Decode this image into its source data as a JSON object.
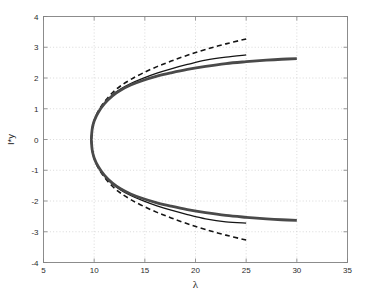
{
  "chart_data": {
    "type": "line",
    "title": "",
    "xlabel": "λ",
    "ylabel": "I*y",
    "xlim": [
      5,
      35
    ],
    "ylim": [
      -4,
      4
    ],
    "xticks": [
      5,
      10,
      15,
      20,
      25,
      30,
      35
    ],
    "yticks": [
      -4,
      -3,
      -2,
      -1,
      0,
      1,
      2,
      3,
      4
    ],
    "xtick_labels": [
      "5",
      "10",
      "15",
      "20",
      "25",
      "30",
      "35"
    ],
    "ytick_labels": [
      "-4",
      "-3",
      "-2",
      "-1",
      "0",
      "1",
      "2",
      "3",
      "4"
    ],
    "grid": true,
    "grid_style": "dotted",
    "grid_color": "#c8c8c8",
    "background_color": "#ffffff",
    "axes_color": "#808080",
    "legend": null,
    "legend_position": "none",
    "vertex_lambda": 9.7,
    "series": [
      {
        "name": "dashed-upper",
        "style": "dashed",
        "color": "#151515",
        "width": 1.6,
        "x": [
          9.72,
          9.8,
          10.0,
          10.4,
          11.0,
          11.8,
          12.6,
          13.6,
          14.8,
          16.2,
          17.6,
          19.2,
          21.0,
          23.0,
          25.0
        ],
        "y": [
          0.0,
          0.34,
          0.62,
          0.92,
          1.22,
          1.52,
          1.74,
          1.95,
          2.16,
          2.37,
          2.55,
          2.74,
          2.93,
          3.11,
          3.27
        ]
      },
      {
        "name": "dashed-lower",
        "style": "dashed",
        "color": "#151515",
        "width": 1.6,
        "x": [
          9.72,
          9.8,
          10.0,
          10.4,
          11.0,
          11.8,
          12.6,
          13.6,
          14.8,
          16.2,
          17.6,
          19.2,
          21.0,
          23.0,
          25.0
        ],
        "y": [
          0.0,
          -0.34,
          -0.62,
          -0.92,
          -1.22,
          -1.52,
          -1.74,
          -1.95,
          -2.16,
          -2.37,
          -2.55,
          -2.74,
          -2.93,
          -3.11,
          -3.27
        ]
      },
      {
        "name": "thin-solid-upper",
        "style": "solid",
        "color": "#151515",
        "width": 1.3,
        "x": [
          9.72,
          9.8,
          10.0,
          10.4,
          11.0,
          11.8,
          12.6,
          13.6,
          14.8,
          16.2,
          17.6,
          19.2,
          21.0,
          23.0,
          25.0
        ],
        "y": [
          0.0,
          0.33,
          0.6,
          0.89,
          1.18,
          1.45,
          1.64,
          1.82,
          1.99,
          2.16,
          2.3,
          2.44,
          2.58,
          2.68,
          2.75
        ]
      },
      {
        "name": "thin-solid-lower",
        "style": "solid",
        "color": "#151515",
        "width": 1.3,
        "x": [
          9.72,
          9.8,
          10.0,
          10.4,
          11.0,
          11.8,
          12.6,
          13.6,
          14.8,
          16.2,
          17.6,
          19.2,
          21.0,
          23.0,
          25.0
        ],
        "y": [
          0.0,
          -0.33,
          -0.6,
          -0.89,
          -1.18,
          -1.45,
          -1.64,
          -1.82,
          -1.99,
          -2.16,
          -2.3,
          -2.44,
          -2.58,
          -2.68,
          -2.72
        ]
      },
      {
        "name": "thick-gray-upper",
        "style": "solid",
        "color": "#4a4a4a",
        "width": 2.8,
        "x": [
          9.72,
          9.8,
          10.0,
          10.4,
          11.0,
          11.8,
          12.6,
          13.6,
          14.8,
          16.2,
          17.6,
          19.2,
          21.0,
          23.0,
          25.0,
          27.0,
          28.5,
          30.0
        ],
        "y": [
          0.0,
          0.33,
          0.6,
          0.88,
          1.16,
          1.42,
          1.6,
          1.77,
          1.92,
          2.06,
          2.17,
          2.28,
          2.38,
          2.47,
          2.53,
          2.58,
          2.61,
          2.63
        ]
      },
      {
        "name": "thick-gray-lower",
        "style": "solid",
        "color": "#4a4a4a",
        "width": 2.8,
        "x": [
          9.72,
          9.8,
          10.0,
          10.4,
          11.0,
          11.8,
          12.6,
          13.6,
          14.8,
          16.2,
          17.6,
          19.2,
          21.0,
          23.0,
          25.0,
          27.0,
          28.5,
          30.0
        ],
        "y": [
          0.0,
          -0.33,
          -0.6,
          -0.88,
          -1.16,
          -1.42,
          -1.6,
          -1.77,
          -1.92,
          -2.06,
          -2.17,
          -2.28,
          -2.38,
          -2.47,
          -2.53,
          -2.58,
          -2.61,
          -2.63
        ]
      }
    ]
  }
}
